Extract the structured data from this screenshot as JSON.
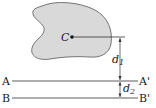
{
  "figure": {
    "centroid_label": "C",
    "axis_a": {
      "left": "A",
      "right": "A'"
    },
    "axis_b": {
      "left": "B",
      "right": "B'"
    },
    "dim1": {
      "symbol": "d",
      "subscript": "1"
    },
    "dim2": {
      "symbol": "d",
      "subscript": "2"
    },
    "colors": {
      "area_fill": "#d9d9d9",
      "area_stroke": "#555555",
      "line": "#333333"
    }
  }
}
